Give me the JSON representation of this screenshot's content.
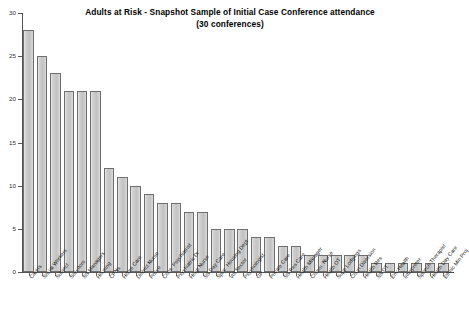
{
  "chart_data": {
    "type": "bar",
    "title": "Adults at Risk - Snapshot Sample of Initial Case Conference attendance",
    "subtitle": "(30 conferences)",
    "xlabel": "",
    "ylabel": "",
    "ylim": [
      0,
      30
    ],
    "yticks": [
      0,
      5,
      10,
      15,
      20,
      25,
      30
    ],
    "grid": false,
    "legend": false,
    "bar_color": "#c9c9c9",
    "bar_edge_color": "#6e6e6e",
    "categories": [
      "Carers",
      "Social Workers",
      "Subject",
      "Solicitors",
      "SS Managers",
      "Housing",
      "CPNs",
      "Home Care",
      "District Nurse",
      "Police",
      "Cons. Psychiatrist",
      "Psychiatric Dr",
      "Hosp Nurse",
      "SS Day Care",
      "Spec. Housing Dept",
      "Vol Sector",
      "Psychologist",
      "GP",
      "Private Care",
      "SS Res Care",
      "Health Manager",
      "Comm. Nurse",
      "Health OT",
      "Supp Lodgings",
      "Court Diversion",
      "Health Res",
      "SS OT",
      "Env Health",
      "Interpreter",
      "Speech Therapist",
      "Health Day Care",
      "Ethnic Min Proj"
    ],
    "values": [
      28,
      25,
      23,
      21,
      21,
      21,
      12,
      11,
      10,
      9,
      8,
      8,
      7,
      7,
      5,
      5,
      5,
      4,
      4,
      3,
      3,
      2,
      2,
      2,
      2,
      2,
      1,
      1,
      1,
      1,
      1,
      1
    ]
  }
}
